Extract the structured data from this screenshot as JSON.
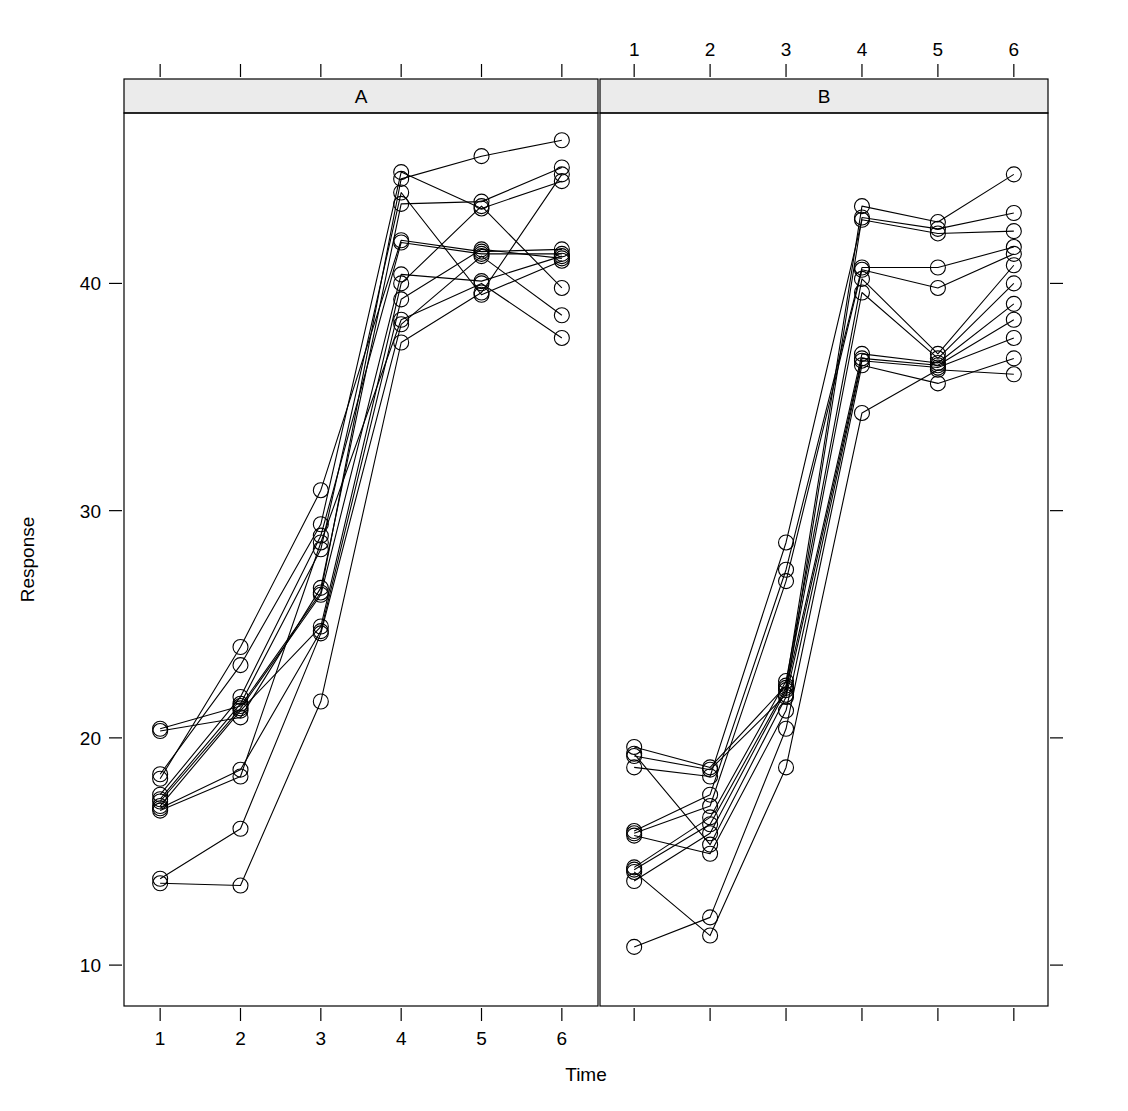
{
  "figure": {
    "type": "trellis-spaghetti-plot",
    "width": 1128,
    "height": 1111,
    "background": "#ffffff",
    "foreground": "#000000",
    "strip_fill": "#ebebeb",
    "strip_border": "#000000",
    "point_symbol": "open-circle",
    "point_radius": 7.5,
    "line_width": 1.1
  },
  "axes": {
    "x_title": "Time",
    "y_title": "Response",
    "x_ticks": [
      "1",
      "2",
      "3",
      "4",
      "5",
      "6"
    ],
    "x_tick_values": [
      1,
      2,
      3,
      4,
      5,
      6
    ],
    "y_ticks": [
      "10",
      "20",
      "30",
      "40"
    ],
    "y_tick_values": [
      10,
      20,
      30,
      40
    ],
    "ylim": [
      8.2,
      47.5
    ],
    "xlim": [
      0.55,
      6.45
    ],
    "grid": false
  },
  "panels": [
    {
      "id": "A",
      "label": "A",
      "strip_label": "A",
      "x_axis_side": "bottom"
    },
    {
      "id": "B",
      "label": "B",
      "strip_label": "B",
      "x_axis_side": "top"
    }
  ],
  "chart_data": {
    "type": "line",
    "title": "",
    "subtitle": "",
    "xlabel": "Time",
    "ylabel": "Response",
    "xlim": [
      0.55,
      6.45
    ],
    "ylim": [
      8.2,
      47.5
    ],
    "x": [
      1,
      2,
      3,
      4,
      5,
      6
    ],
    "grid": false,
    "legend": "none",
    "panel_variable": "Group",
    "panels": [
      {
        "panel": "A",
        "series": [
          {
            "name": "A1",
            "values": [
              20.4,
              21.4,
              26.4,
              44.6,
              45.6,
              46.3
            ]
          },
          {
            "name": "A2",
            "values": [
              20.3,
              20.9,
              26.6,
              43.5,
              43.6,
              45.1
            ]
          },
          {
            "name": "A3",
            "values": [
              18.4,
              23.2,
              29.4,
              44.9,
              43.3,
              44.5
            ]
          },
          {
            "name": "A4",
            "values": [
              18.2,
              24.0,
              30.9,
              41.9,
              41.4,
              41.5
            ]
          },
          {
            "name": "A5",
            "values": [
              17.5,
              21.8,
              28.9,
              41.8,
              41.3,
              41.3
            ]
          },
          {
            "name": "A6",
            "values": [
              17.3,
              21.5,
              28.3,
              44.0,
              39.5,
              41.0
            ]
          },
          {
            "name": "A7",
            "values": [
              17.2,
              21.3,
              26.3,
              40.4,
              40.1,
              41.2
            ]
          },
          {
            "name": "A8",
            "values": [
              17.0,
              21.2,
              24.9,
              40.0,
              43.4,
              39.8
            ]
          },
          {
            "name": "A9",
            "values": [
              16.9,
              18.6,
              24.7,
              39.3,
              41.5,
              41.1
            ]
          },
          {
            "name": "A10",
            "values": [
              16.8,
              18.3,
              28.6,
              38.4,
              40.0,
              37.6
            ]
          },
          {
            "name": "A11",
            "values": [
              13.8,
              16.0,
              24.6,
              38.2,
              41.2,
              38.6
            ]
          },
          {
            "name": "A12",
            "values": [
              13.6,
              13.5,
              21.6,
              37.4,
              39.6,
              44.8
            ]
          }
        ]
      },
      {
        "panel": "B",
        "series": [
          {
            "name": "B1",
            "values": [
              19.6,
              18.7,
              22.3,
              43.4,
              42.7,
              44.8
            ]
          },
          {
            "name": "B2",
            "values": [
              19.2,
              18.6,
              21.9,
              42.9,
              42.4,
              43.1
            ]
          },
          {
            "name": "B3",
            "values": [
              18.7,
              18.3,
              28.6,
              42.8,
              42.2,
              42.3
            ]
          },
          {
            "name": "B4",
            "values": [
              15.9,
              17.5,
              27.4,
              40.7,
              40.7,
              41.6
            ]
          },
          {
            "name": "B5",
            "values": [
              15.8,
              17.0,
              26.9,
              40.6,
              39.8,
              41.3
            ]
          },
          {
            "name": "B6",
            "values": [
              14.3,
              16.5,
              22.5,
              40.2,
              36.9,
              40.8
            ]
          },
          {
            "name": "B7",
            "values": [
              14.2,
              16.2,
              22.2,
              39.6,
              36.7,
              40.0
            ]
          },
          {
            "name": "B8",
            "values": [
              13.7,
              15.8,
              22.1,
              36.9,
              36.5,
              39.1
            ]
          },
          {
            "name": "B9",
            "values": [
              19.3,
              15.3,
              21.8,
              36.7,
              36.4,
              38.4
            ]
          },
          {
            "name": "B10",
            "values": [
              15.7,
              14.9,
              21.2,
              36.6,
              36.3,
              37.6
            ]
          },
          {
            "name": "B11",
            "values": [
              10.8,
              12.1,
              20.4,
              36.4,
              35.6,
              36.7
            ]
          },
          {
            "name": "B12",
            "values": [
              14.1,
              11.3,
              18.7,
              34.3,
              36.2,
              36.0
            ]
          }
        ]
      }
    ]
  }
}
